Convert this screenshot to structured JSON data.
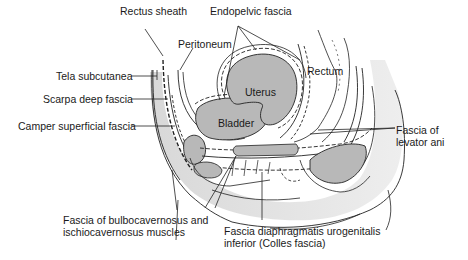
{
  "diagram": {
    "type": "anatomical-illustration",
    "labels": {
      "rectus_sheath": "Rectus sheath",
      "endopelvic_fascia": "Endopelvic fascia",
      "peritoneum": "Peritoneum",
      "tela_subcutanea": "Tela subcutanea",
      "scarpa": "Scarpa deep fascia",
      "camper": "Camper superficial fascia",
      "levator_line1": "Fascia of",
      "levator_line2": "levator ani",
      "bulbo_line1": "Fascia of bulbocavernosus and",
      "bulbo_line2": "ischiocavernosus muscles",
      "colles_line1": "Fascia diaphragmatis urogenitalis",
      "colles_line2": "inferior (Colles fascia)"
    },
    "organs": {
      "rectum": "Rectum",
      "uterus": "Uterus",
      "bladder": "Bladder"
    },
    "colors": {
      "line": "#222222",
      "organ_fill": "#b8b8b8",
      "tissue_fill": "#e2e2e2",
      "background": "#ffffff"
    }
  }
}
